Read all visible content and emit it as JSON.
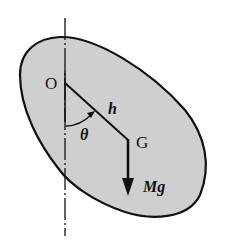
{
  "diagram": {
    "type": "physical-pendulum",
    "colors": {
      "body_fill": "#cfcfcf",
      "stroke": "#111111",
      "background": "#ffffff"
    },
    "labels": {
      "pivot": "O",
      "center_of_mass": "G",
      "distance": "h",
      "angle": "θ",
      "weight": "Mg"
    }
  }
}
